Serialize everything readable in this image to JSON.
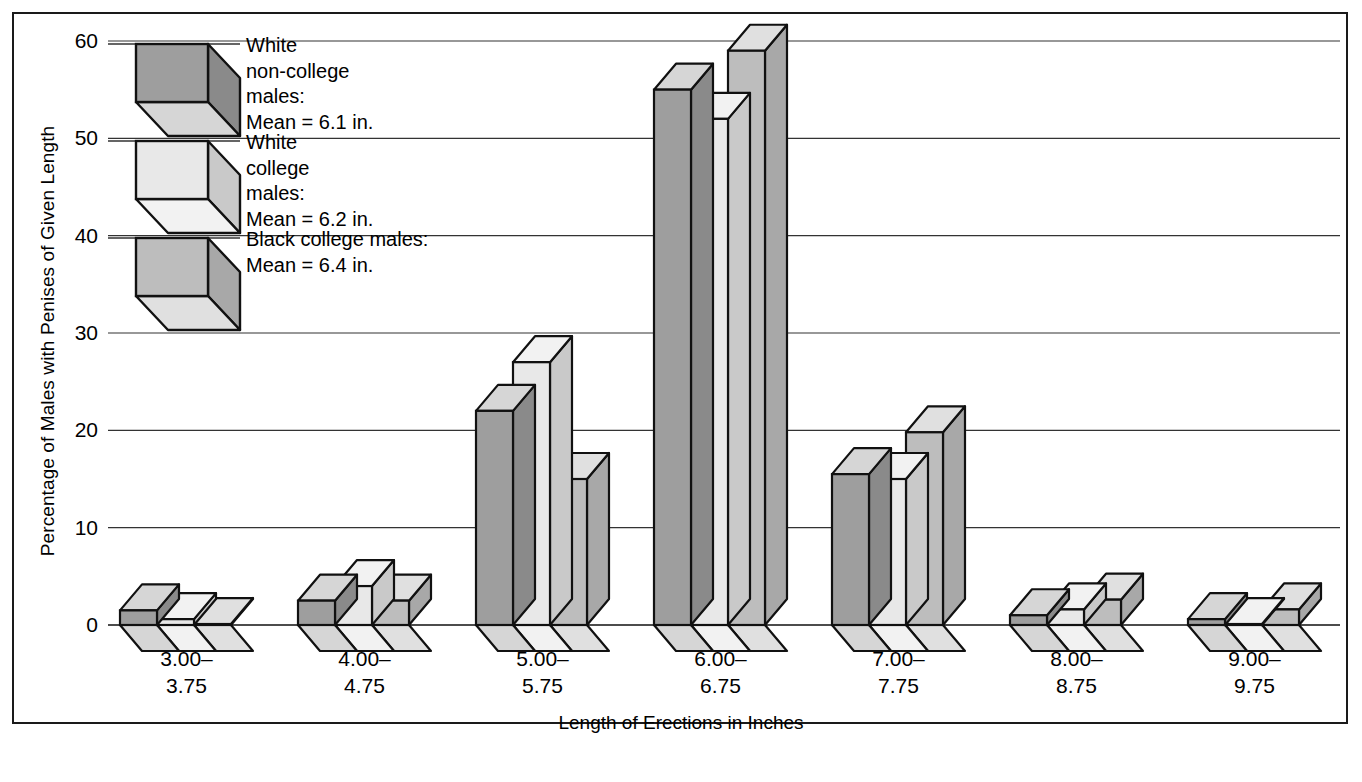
{
  "chart_data": {
    "type": "bar",
    "title": "",
    "subtitle": "",
    "xlabel": "Length of Erections in Inches",
    "ylabel": "Percentage of Males with Penises of Given Length",
    "categories": [
      "3.00–3.75",
      "4.00–4.75",
      "5.00–5.75",
      "6.00–6.75",
      "7.00–7.75",
      "8.00–8.75",
      "9.00–9.75"
    ],
    "category_lines": [
      [
        "3.00–",
        "3.75"
      ],
      [
        "4.00–",
        "4.75"
      ],
      [
        "5.00–",
        "5.75"
      ],
      [
        "6.00–",
        "6.75"
      ],
      [
        "7.00–",
        "7.75"
      ],
      [
        "8.00–",
        "8.75"
      ],
      [
        "9.00–",
        "9.75"
      ]
    ],
    "series": [
      {
        "name": "White non-college males",
        "mean": "6.1",
        "color": "#9e9e9e",
        "values": [
          1.5,
          2.5,
          22,
          55,
          15.5,
          1,
          0.6
        ]
      },
      {
        "name": "White college males",
        "mean": "6.2",
        "color": "#e3e3e3",
        "values": [
          0.6,
          4,
          27,
          52,
          15,
          1.6,
          0.1
        ]
      },
      {
        "name": "Black college males",
        "mean": "6.4",
        "color": "#bdbdbd",
        "values": [
          0.1,
          2.5,
          15,
          59,
          19.8,
          2.6,
          1.6
        ]
      }
    ],
    "yticks": [
      0,
      10,
      20,
      30,
      40,
      50,
      60
    ],
    "ylim": [
      0,
      63
    ],
    "grid": true,
    "legend_position": "top-left"
  },
  "legend": {
    "items": [
      {
        "swatch": "legend-swatch-white-non-college",
        "text": "White\nnon-college\nmales:\nMean  =  6.1 in."
      },
      {
        "swatch": "legend-swatch-white-college",
        "text": "White\ncollege\nmales:\nMean  =  6.2 in."
      },
      {
        "swatch": "legend-swatch-black-college",
        "text": "Black college males:\nMean  =  6.4 in."
      }
    ]
  },
  "colors": {
    "series1_front": "#9e9e9e",
    "series1_side": "#8a8a8a",
    "series1_top": "#d6d6d6",
    "series2_front": "#e8e8e8",
    "series2_side": "#c9c9c9",
    "series2_top": "#f2f2f2",
    "series3_front": "#bdbdbd",
    "series3_side": "#a8a8a8",
    "series3_top": "#e0e0e0",
    "outline": "#111111",
    "grid": "#333333",
    "frame": "#1a1a1a"
  }
}
